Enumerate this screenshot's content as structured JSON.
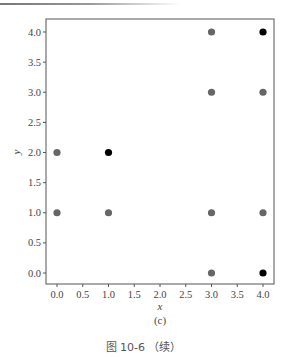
{
  "chart_data": {
    "type": "scatter",
    "title": "",
    "xlabel": "x",
    "ylabel": "y",
    "xlim": [
      -0.2,
      4.2
    ],
    "ylim": [
      -0.2,
      4.2
    ],
    "grid": false,
    "xticks": [
      0.0,
      0.5,
      1.0,
      1.5,
      2.0,
      2.5,
      3.0,
      3.5,
      4.0
    ],
    "yticks": [
      0.0,
      0.5,
      1.0,
      1.5,
      2.0,
      2.5,
      3.0,
      3.5,
      4.0
    ],
    "xtick_labels": [
      "0.0",
      "0.5",
      "1.0",
      "1.5",
      "2.0",
      "2.5",
      "3.0",
      "3.5",
      "4.0"
    ],
    "ytick_labels": [
      "0.0",
      "0.5",
      "1.0",
      "1.5",
      "2.0",
      "2.5",
      "3.0",
      "3.5",
      "4.0"
    ],
    "series": [
      {
        "name": "gray",
        "color": "#666666",
        "points": [
          [
            0,
            1
          ],
          [
            0,
            2
          ],
          [
            1,
            1
          ],
          [
            3,
            0
          ],
          [
            3,
            1
          ],
          [
            3,
            3
          ],
          [
            3,
            4
          ],
          [
            4,
            1
          ],
          [
            4,
            3
          ]
        ]
      },
      {
        "name": "black",
        "color": "#000000",
        "points": [
          [
            1,
            2
          ],
          [
            4,
            0
          ],
          [
            4,
            4
          ]
        ]
      }
    ],
    "subfigure_label": "(c)"
  },
  "caption": "图 10-6 （续）"
}
